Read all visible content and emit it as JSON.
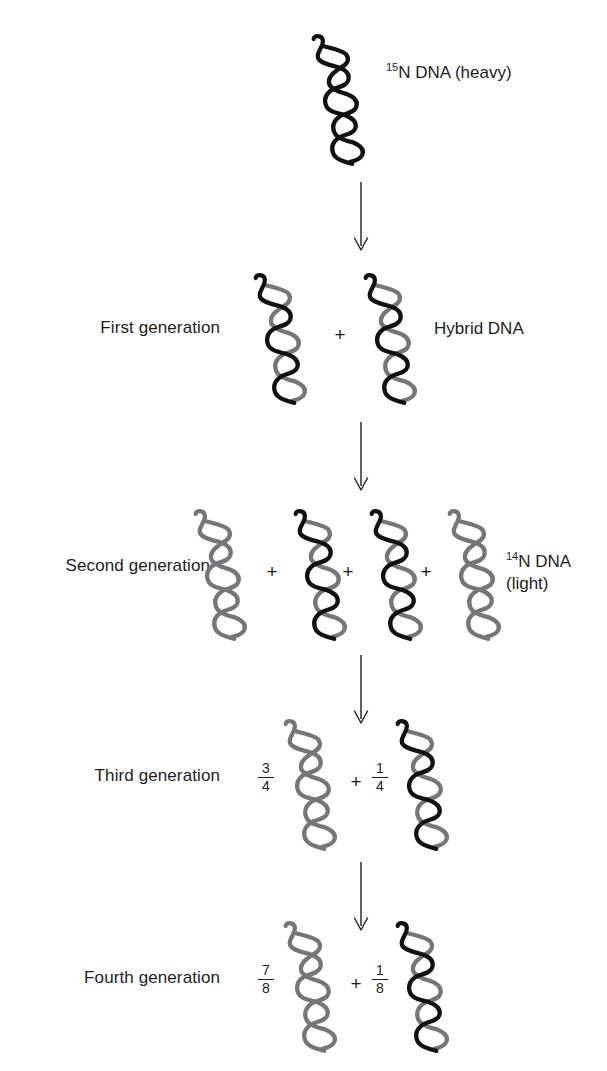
{
  "diagram": {
    "colors": {
      "heavy_strand": "#111111",
      "light_strand": "#767676",
      "text": "#1d1d1d",
      "background": "#ffffff"
    },
    "rows": [
      {
        "id": "parental",
        "label": "",
        "right_label_line1": "N DNA (heavy)",
        "right_label_sup": "15",
        "right_label_line2": "",
        "molecules": [
          {
            "strands": [
              "heavy",
              "heavy"
            ],
            "fraction": ""
          }
        ],
        "plus_signs": 0
      },
      {
        "id": "first-generation",
        "label": "First generation",
        "right_label_line1": "Hybrid DNA",
        "right_label_sup": "",
        "right_label_line2": "",
        "molecules": [
          {
            "strands": [
              "heavy",
              "light"
            ],
            "fraction": ""
          },
          {
            "strands": [
              "heavy",
              "light"
            ],
            "fraction": ""
          }
        ],
        "plus_signs": 1
      },
      {
        "id": "second-generation",
        "label": "Second generation",
        "right_label_line1": "N DNA",
        "right_label_sup": "14",
        "right_label_line2": "(light)",
        "molecules": [
          {
            "strands": [
              "light",
              "light"
            ],
            "fraction": ""
          },
          {
            "strands": [
              "heavy",
              "light"
            ],
            "fraction": ""
          },
          {
            "strands": [
              "heavy",
              "light"
            ],
            "fraction": ""
          },
          {
            "strands": [
              "light",
              "light"
            ],
            "fraction": ""
          }
        ],
        "plus_signs": 3
      },
      {
        "id": "third-generation",
        "label": "Third generation",
        "right_label_line1": "",
        "right_label_sup": "",
        "right_label_line2": "",
        "molecules": [
          {
            "strands": [
              "light",
              "light"
            ],
            "fraction": "3/4",
            "numerator": "3",
            "denominator": "4"
          },
          {
            "strands": [
              "heavy",
              "light"
            ],
            "fraction": "1/4",
            "numerator": "1",
            "denominator": "4"
          }
        ],
        "plus_signs": 1
      },
      {
        "id": "fourth-generation",
        "label": "Fourth generation",
        "right_label_line1": "",
        "right_label_sup": "",
        "right_label_line2": "",
        "molecules": [
          {
            "strands": [
              "light",
              "light"
            ],
            "fraction": "7/8",
            "numerator": "7",
            "denominator": "8"
          },
          {
            "strands": [
              "heavy",
              "light"
            ],
            "fraction": "1/8",
            "numerator": "1",
            "denominator": "8"
          }
        ],
        "plus_signs": 1
      }
    ],
    "labels": {
      "parental_sup": "15",
      "parental_text": "N DNA (heavy)",
      "first_generation": "First generation",
      "hybrid_dna": "Hybrid DNA",
      "second_generation": "Second generation",
      "light_sup": "14",
      "light_text": "N DNA",
      "light_text2": "(light)",
      "third_generation": "Third generation",
      "fourth_generation": "Fourth generation",
      "plus": "+",
      "frac34_num": "3",
      "frac34_den": "4",
      "frac14_num": "1",
      "frac14_den": "4",
      "frac78_num": "7",
      "frac78_den": "8",
      "frac18_num": "1",
      "frac18_den": "8"
    },
    "arrows": {
      "count": 4,
      "direction": "down"
    }
  }
}
